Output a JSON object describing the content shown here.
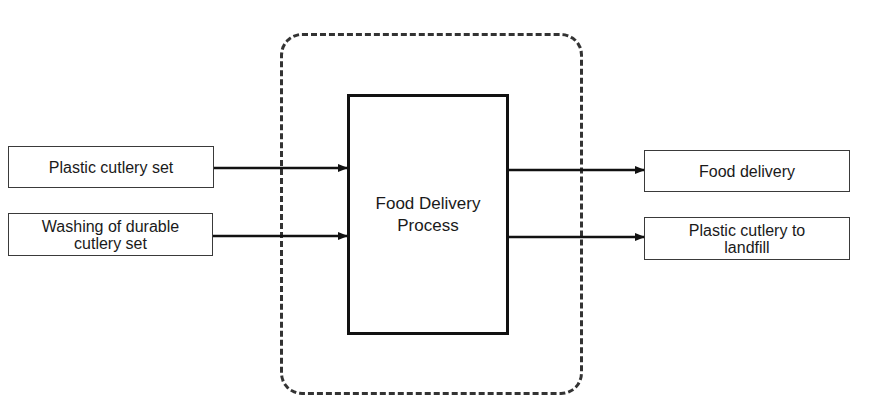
{
  "diagram": {
    "type": "process-flow",
    "system_boundary": {
      "style": "dashed-rounded"
    },
    "process": {
      "label": "Food Delivery\nProcess"
    },
    "inputs": [
      {
        "label": "Plastic cutlery set"
      },
      {
        "label": "Washing of durable\ncutlery set"
      }
    ],
    "outputs": [
      {
        "label": "Food delivery"
      },
      {
        "label": "Plastic cutlery to\nlandfill"
      }
    ],
    "colors": {
      "line": "#111111",
      "border": "#3a3a3a",
      "background": "#ffffff"
    }
  }
}
